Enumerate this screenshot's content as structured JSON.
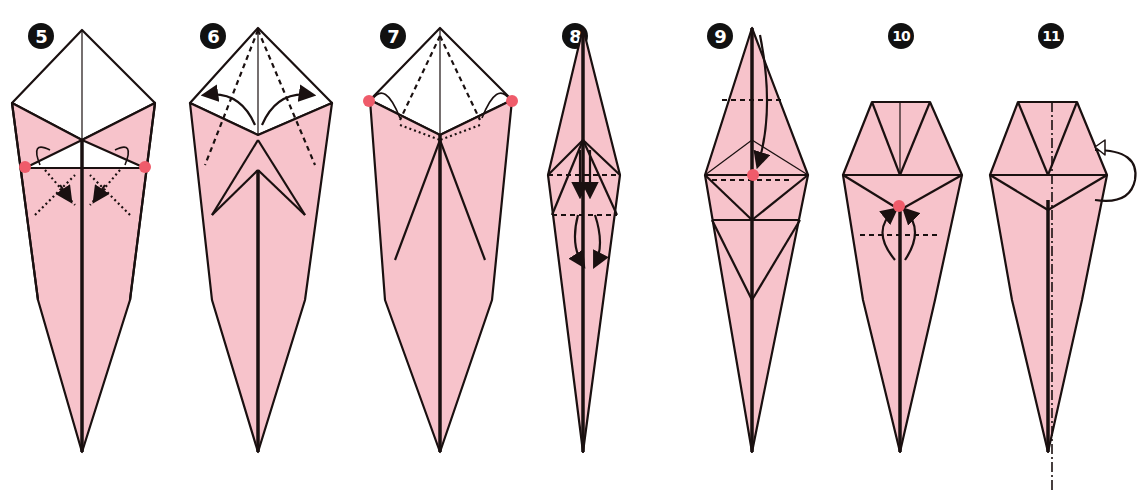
{
  "diagram": {
    "colors": {
      "paper_colored": "#f7c3cb",
      "paper_white": "#ffffff",
      "line": "#1a1010",
      "reference_dot": "#ef5b6a",
      "badge": "#111111"
    },
    "steps": [
      {
        "number": "5",
        "x": 40,
        "label": "step-5"
      },
      {
        "number": "6",
        "x": 230,
        "label": "step-6"
      },
      {
        "number": "7",
        "x": 385,
        "label": "step-7"
      },
      {
        "number": "8",
        "x": 580,
        "label": "step-8"
      },
      {
        "number": "9",
        "x": 720,
        "label": "step-9"
      },
      {
        "number": "10",
        "x": 885,
        "label": "step-10"
      },
      {
        "number": "11",
        "x": 1040,
        "label": "step-11"
      }
    ]
  }
}
